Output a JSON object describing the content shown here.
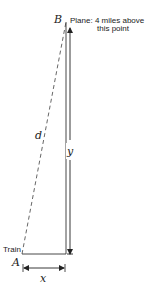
{
  "diagram": {
    "type": "related-rates right triangle",
    "vertices": {
      "A": "A",
      "B": "B"
    },
    "labels": {
      "plane_line1": "Plane: 4 miles above",
      "plane_line2": "this point",
      "train": "Train",
      "hypotenuse": "d",
      "vertical": "y",
      "horizontal": "x"
    },
    "colors": {
      "line": "#222222",
      "dashed": "#555555",
      "background": "#ffffff"
    }
  }
}
